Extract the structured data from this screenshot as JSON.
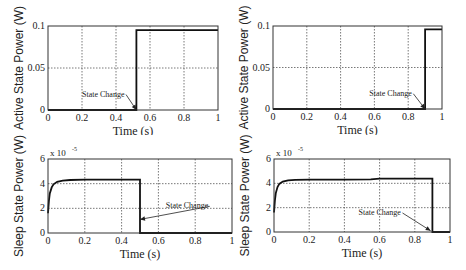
{
  "chart_data": [
    {
      "type": "line",
      "panel": "top-left",
      "title": "",
      "xlabel": "Time (s)",
      "ylabel": "Active State Power (W)",
      "xlim": [
        0,
        1
      ],
      "ylim": [
        0,
        0.1
      ],
      "xticks": [
        "0",
        "0.2",
        "0.4",
        "0.6",
        "0.8",
        "1"
      ],
      "yticks": [
        "0",
        "0.05",
        "0.1"
      ],
      "y_multiplier": "",
      "grid": true,
      "series": [
        {
          "name": "Active State Power",
          "x": [
            0,
            0.52,
            0.52,
            0.6,
            1.0
          ],
          "y": [
            0,
            0,
            0.095,
            0.095,
            0.095
          ]
        }
      ],
      "annotation": {
        "text": "State Change",
        "text_x": 0.2,
        "text_y": 0.016,
        "arrow_to_x": 0.52,
        "arrow_to_y": 0.0
      }
    },
    {
      "type": "line",
      "panel": "top-right",
      "title": "",
      "xlabel": "Time (s)",
      "ylabel": "Active State Power (W)",
      "xlim": [
        0,
        1
      ],
      "ylim": [
        0,
        0.1
      ],
      "xticks": [
        "0",
        "0.2",
        "0.4",
        "0.6",
        "0.8",
        "1"
      ],
      "yticks": [
        "0",
        "0.05",
        "0.1"
      ],
      "y_multiplier": "",
      "grid": true,
      "series": [
        {
          "name": "Active State Power",
          "x": [
            0,
            0.9,
            0.9,
            1.0
          ],
          "y": [
            0,
            0,
            0.096,
            0.096
          ]
        }
      ],
      "annotation": {
        "text": "State Change",
        "text_x": 0.57,
        "text_y": 0.016,
        "arrow_to_x": 0.9,
        "arrow_to_y": 0.0
      }
    },
    {
      "type": "line",
      "panel": "bottom-left",
      "title": "",
      "xlabel": "Time (s)",
      "ylabel": "Sleep State Power (W)",
      "xlim": [
        0,
        1
      ],
      "ylim": [
        0,
        6
      ],
      "xticks": [
        "0",
        "0.2",
        "0.4",
        "0.6",
        "0.8",
        "1"
      ],
      "yticks": [
        "0",
        "2",
        "4",
        "6"
      ],
      "y_multiplier": "x 10^-5",
      "y_multiplier_base": "x 10",
      "y_multiplier_exp": "-5",
      "grid": true,
      "series": [
        {
          "name": "Sleep State Power (x1e-5 W)",
          "x": [
            0,
            0.005,
            0.01,
            0.02,
            0.03,
            0.05,
            0.08,
            0.12,
            0.2,
            0.3,
            0.4,
            0.5,
            0.5,
            0.6,
            1.0
          ],
          "y": [
            1.6,
            2.6,
            3.2,
            3.7,
            3.95,
            4.15,
            4.25,
            4.3,
            4.32,
            4.33,
            4.33,
            4.33,
            0,
            0,
            0
          ]
        }
      ],
      "annotation": {
        "text": "State Change",
        "text_x": 0.64,
        "text_y": 2.0,
        "arrow_to_x": 0.5,
        "arrow_to_y": 1.1
      }
    },
    {
      "type": "line",
      "panel": "bottom-right",
      "title": "",
      "xlabel": "Time (s)",
      "ylabel": "Sleep State Power (W)",
      "xlim": [
        0,
        1
      ],
      "ylim": [
        0,
        6
      ],
      "xticks": [
        "0",
        "0.2",
        "0.4",
        "0.6",
        "0.8",
        "1"
      ],
      "yticks": [
        "0",
        "2",
        "4",
        "6"
      ],
      "y_multiplier": "x 10^-5",
      "y_multiplier_base": "x 10",
      "y_multiplier_exp": "-5",
      "grid": true,
      "series": [
        {
          "name": "Sleep State Power (x1e-5 W)",
          "x": [
            0,
            0.005,
            0.01,
            0.02,
            0.03,
            0.05,
            0.08,
            0.12,
            0.2,
            0.4,
            0.55,
            0.6,
            0.8,
            0.9,
            0.9,
            1.0
          ],
          "y": [
            1.6,
            2.6,
            3.2,
            3.7,
            3.95,
            4.15,
            4.25,
            4.28,
            4.3,
            4.3,
            4.32,
            4.38,
            4.38,
            4.38,
            0,
            0
          ]
        }
      ],
      "annotation": {
        "text": "State Change",
        "text_x": 0.48,
        "text_y": 1.4,
        "arrow_to_x": 0.89,
        "arrow_to_y": 0.1
      }
    }
  ]
}
